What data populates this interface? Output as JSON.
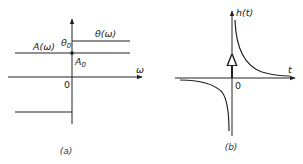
{
  "panel_a": {
    "caption": "(a)",
    "x_axis_label": "ω",
    "origin_label": "0",
    "amplitude_label": "A(ω)",
    "phase_label": "θ(ω)",
    "theta0_label": "θ",
    "theta0_sub": "0",
    "a0_label": "A",
    "a0_sub": "0"
  },
  "panel_b": {
    "caption": "(b)",
    "y_axis_label": "h(t)",
    "x_axis_label": "t",
    "origin_label": "0"
  },
  "colors": {
    "stroke": "#222222",
    "background": "#ffffff"
  }
}
